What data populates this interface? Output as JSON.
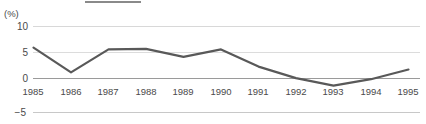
{
  "chart_data": {
    "type": "line",
    "title": "",
    "subtitle": "",
    "xlabel": "",
    "ylabel": "(%)",
    "categories": [
      "1985",
      "1986",
      "1987",
      "1988",
      "1989",
      "1990",
      "1991",
      "1992",
      "1993",
      "1994",
      "1995"
    ],
    "values": [
      6.3,
      2.0,
      6.0,
      6.1,
      4.7,
      6.0,
      3.0,
      1.0,
      -0.3,
      0.8,
      2.5
    ],
    "series": [
      {
        "name": "",
        "values": [
          6.3,
          2.0,
          6.0,
          6.1,
          4.7,
          6.0,
          3.0,
          1.0,
          -0.3,
          0.8,
          2.5
        ]
      }
    ],
    "ylim": [
      -5,
      10
    ],
    "yticks": [
      10,
      5,
      0,
      -5
    ],
    "ytick_labels": [
      "10",
      "5",
      "0",
      "-5"
    ],
    "xlim": [
      "1985",
      "1995"
    ],
    "grid": true,
    "grid_axis": "y",
    "legend": false,
    "legend_position": "none",
    "line_color": "#595959",
    "grid_color": "#d8d8d8",
    "zero_line_color": "#9a9a9a",
    "text_color": "#4a4a4a",
    "background": "#ffffff",
    "markers": false,
    "annotations": []
  },
  "axis": {
    "unit_label": "(%)",
    "y_labels": [
      "10",
      "5",
      "0",
      "−5"
    ],
    "x_labels": [
      "1985",
      "1986",
      "1987",
      "1988",
      "1989",
      "1990",
      "1991",
      "1992",
      "1993",
      "1994",
      "1995"
    ]
  },
  "decor": {
    "top_rule_color": "#8a8a8a"
  }
}
